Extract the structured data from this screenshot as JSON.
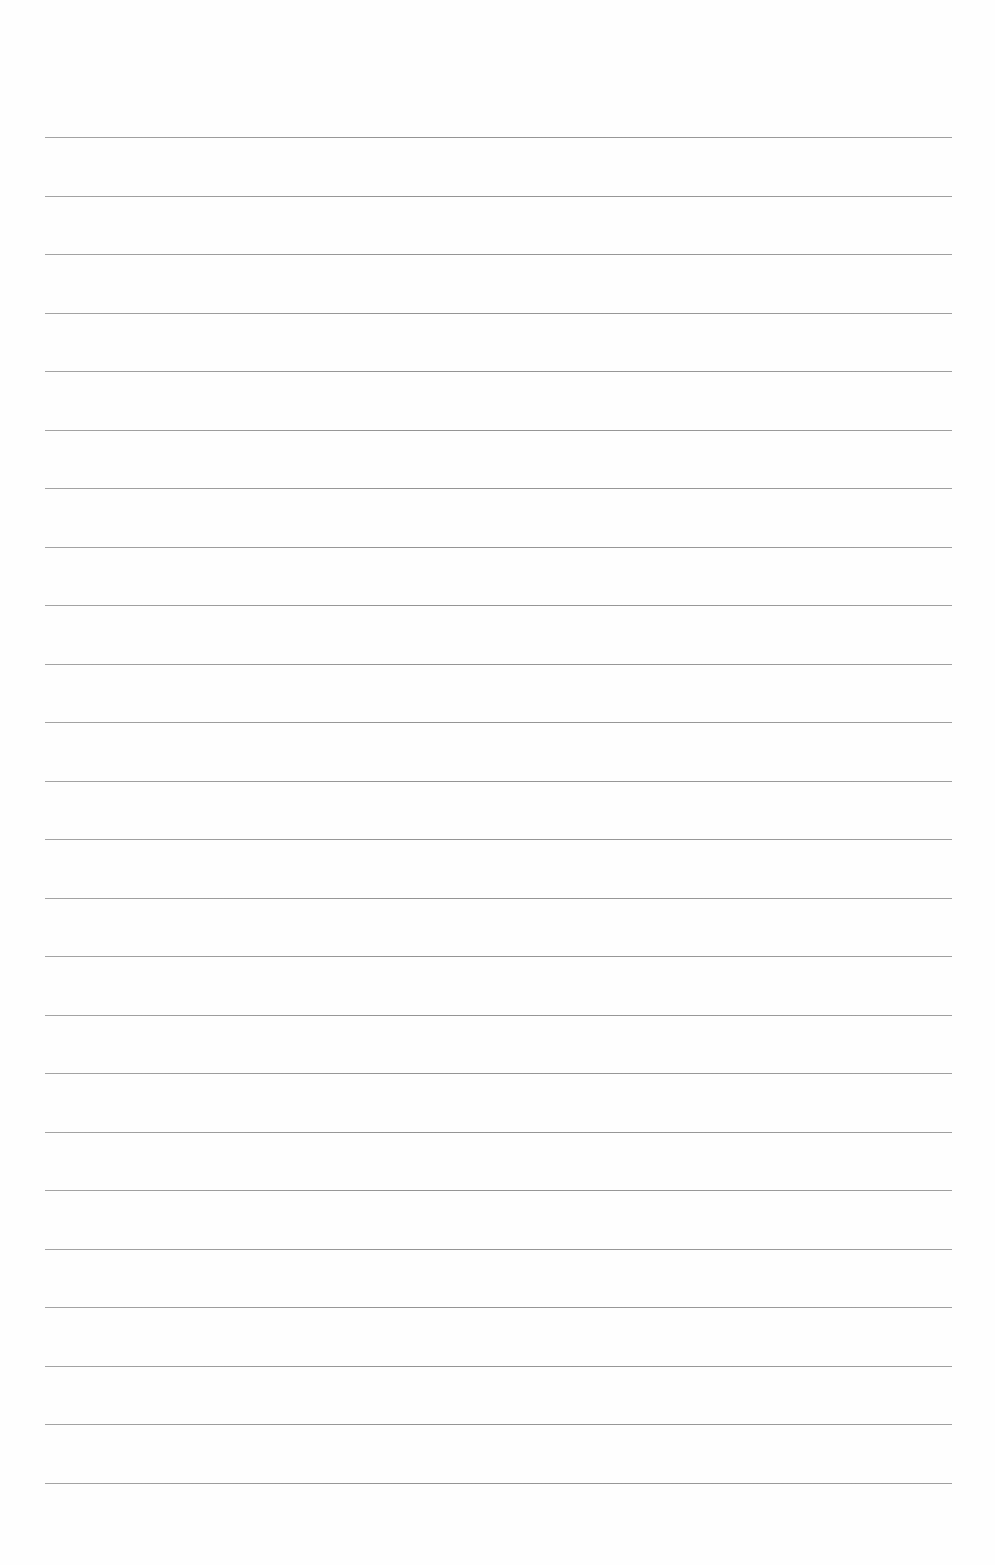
{
  "page": {
    "type": "lined-paper",
    "background_color": "#fefefe",
    "line_color": "#8c8c8c",
    "line_count": 24,
    "line_left": 45,
    "line_right": 952,
    "first_line_y": 137,
    "line_spacing": 58.5,
    "lines": [
      {
        "text": ""
      },
      {
        "text": ""
      },
      {
        "text": ""
      },
      {
        "text": ""
      },
      {
        "text": ""
      },
      {
        "text": ""
      },
      {
        "text": ""
      },
      {
        "text": ""
      },
      {
        "text": ""
      },
      {
        "text": ""
      },
      {
        "text": ""
      },
      {
        "text": ""
      },
      {
        "text": ""
      },
      {
        "text": ""
      },
      {
        "text": ""
      },
      {
        "text": ""
      },
      {
        "text": ""
      },
      {
        "text": ""
      },
      {
        "text": ""
      },
      {
        "text": ""
      },
      {
        "text": ""
      },
      {
        "text": ""
      },
      {
        "text": ""
      },
      {
        "text": ""
      }
    ]
  }
}
